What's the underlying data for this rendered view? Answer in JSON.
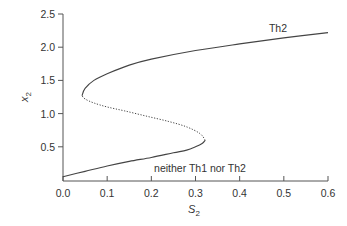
{
  "chart_data": {
    "type": "line",
    "title": "",
    "xlabel": "S",
    "xlabel_sub": "2",
    "ylabel": "x",
    "ylabel_sub": "2",
    "xlim": [
      0.0,
      0.6
    ],
    "ylim": [
      0.0,
      2.5
    ],
    "xticks": [
      "0.0",
      "0.1",
      "0.2",
      "0.3",
      "0.4",
      "0.5",
      "0.6"
    ],
    "yticks": [
      "0.5",
      "1.0",
      "1.5",
      "2.0",
      "2.5"
    ],
    "grid": false,
    "legend": null,
    "annotations": [
      {
        "text": "Th2",
        "x": 0.5,
        "y": 2.3
      },
      {
        "text": "neither Th1 nor Th2",
        "x": 0.25,
        "y": 0.3
      }
    ],
    "series": [
      {
        "name": "stable-lower",
        "style": "solid",
        "x": [
          0.0,
          0.05,
          0.1,
          0.15,
          0.2,
          0.25,
          0.28,
          0.3,
          0.315,
          0.322
        ],
        "y": [
          0.05,
          0.13,
          0.21,
          0.28,
          0.34,
          0.41,
          0.45,
          0.5,
          0.55,
          0.6
        ]
      },
      {
        "name": "unstable-middle",
        "style": "dotted",
        "x": [
          0.322,
          0.31,
          0.28,
          0.24,
          0.19,
          0.14,
          0.1,
          0.07,
          0.05,
          0.043
        ],
        "y": [
          0.6,
          0.7,
          0.8,
          0.88,
          0.96,
          1.04,
          1.1,
          1.16,
          1.22,
          1.27
        ]
      },
      {
        "name": "stable-upper",
        "style": "solid",
        "x": [
          0.043,
          0.05,
          0.07,
          0.1,
          0.15,
          0.2,
          0.3,
          0.4,
          0.5,
          0.6
        ],
        "y": [
          1.27,
          1.38,
          1.5,
          1.6,
          1.73,
          1.82,
          1.95,
          2.05,
          2.14,
          2.22
        ]
      }
    ]
  }
}
